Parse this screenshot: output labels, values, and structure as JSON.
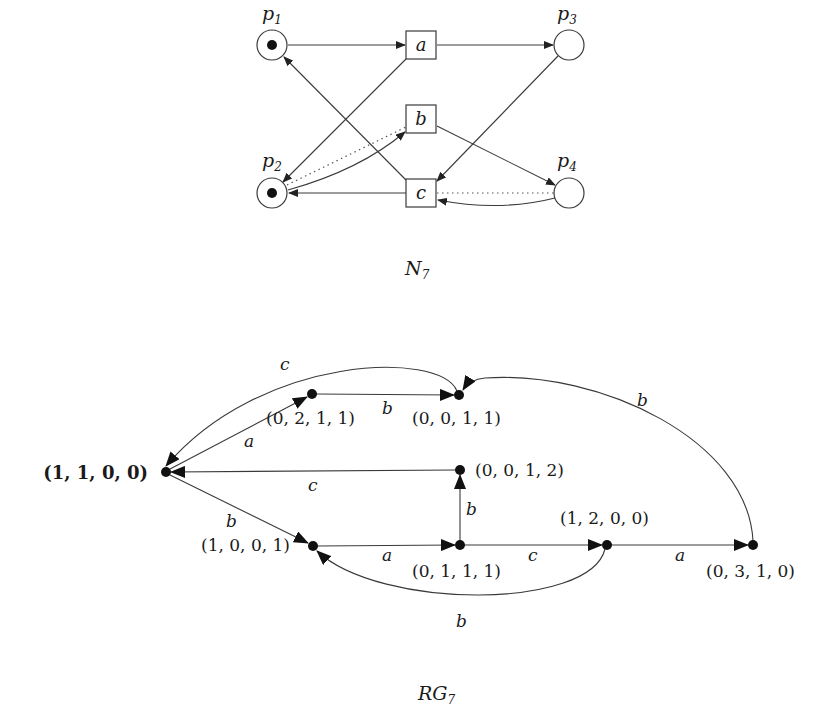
{
  "petri_net": {
    "caption": "N",
    "caption_sub": "7",
    "places": [
      {
        "id": "p1",
        "label": "p",
        "sub": "1",
        "x": 272,
        "y": 45,
        "tokens": 1,
        "lx": 262,
        "ly": 20
      },
      {
        "id": "p2",
        "label": "p",
        "sub": "2",
        "x": 272,
        "y": 193,
        "tokens": 1,
        "lx": 262,
        "ly": 167
      },
      {
        "id": "p3",
        "label": "p",
        "sub": "3",
        "x": 569,
        "y": 45,
        "tokens": 0,
        "lx": 557,
        "ly": 20
      },
      {
        "id": "p4",
        "label": "p",
        "sub": "4",
        "x": 569,
        "y": 193,
        "tokens": 0,
        "lx": 557,
        "ly": 167
      }
    ],
    "transitions": [
      {
        "id": "a",
        "label": "a",
        "x": 421,
        "y": 45
      },
      {
        "id": "b",
        "label": "b",
        "x": 421,
        "y": 119
      },
      {
        "id": "c",
        "label": "c",
        "x": 421,
        "y": 193
      }
    ],
    "arcs": [
      {
        "from": "p1",
        "to": "a",
        "style": "solid"
      },
      {
        "from": "a",
        "to": "p3",
        "style": "solid"
      },
      {
        "from": "a",
        "to": "p2",
        "style": "solid"
      },
      {
        "from": "p2",
        "to": "b",
        "style": "solid",
        "curved": true
      },
      {
        "from": "p2",
        "to": "b",
        "style": "dotted"
      },
      {
        "from": "b",
        "to": "p4",
        "style": "solid"
      },
      {
        "from": "p3",
        "to": "c",
        "style": "solid"
      },
      {
        "from": "c",
        "to": "p1",
        "style": "solid"
      },
      {
        "from": "c",
        "to": "p2",
        "style": "solid"
      },
      {
        "from": "p4",
        "to": "c",
        "style": "solid",
        "curved": true
      },
      {
        "from": "p4",
        "to": "c",
        "style": "dotted"
      }
    ]
  },
  "reachability_graph": {
    "caption": "RG",
    "caption_sub": "7",
    "nodes": [
      {
        "id": "m1100",
        "label": "(1, 1, 0, 0)",
        "x": 166,
        "y": 472,
        "initial": true
      },
      {
        "id": "m0211",
        "label": "(0, 2, 1, 1)",
        "x": 312,
        "y": 394
      },
      {
        "id": "m0011",
        "label": "(0, 0, 1, 1)",
        "x": 459,
        "y": 395
      },
      {
        "id": "m0012",
        "label": "(0, 0, 1, 2)",
        "x": 460,
        "y": 470
      },
      {
        "id": "m1001",
        "label": "(1, 0, 0, 1)",
        "x": 313,
        "y": 546
      },
      {
        "id": "m0111",
        "label": "(0, 1, 1, 1)",
        "x": 460,
        "y": 545
      },
      {
        "id": "m1200",
        "label": "(1, 2, 0, 0)",
        "x": 607,
        "y": 545
      },
      {
        "id": "m0310",
        "label": "(0, 3, 1, 0)",
        "x": 753,
        "y": 545
      }
    ],
    "edges": [
      {
        "from": "m1100",
        "to": "m0211",
        "label": "a"
      },
      {
        "from": "m0211",
        "to": "m0011",
        "label": "b"
      },
      {
        "from": "m0011",
        "to": "m1100",
        "label": "c",
        "curved": true
      },
      {
        "from": "m0012",
        "to": "m1100",
        "label": "c"
      },
      {
        "from": "m1100",
        "to": "m1001",
        "label": "b"
      },
      {
        "from": "m1001",
        "to": "m0111",
        "label": "a"
      },
      {
        "from": "m0111",
        "to": "m0012",
        "label": "b"
      },
      {
        "from": "m0111",
        "to": "m1200",
        "label": "c"
      },
      {
        "from": "m1200",
        "to": "m1001",
        "label": "b",
        "curved": true
      },
      {
        "from": "m1200",
        "to": "m0310",
        "label": "a"
      },
      {
        "from": "m0310",
        "to": "m0011",
        "label": "b",
        "curved": true
      }
    ]
  }
}
